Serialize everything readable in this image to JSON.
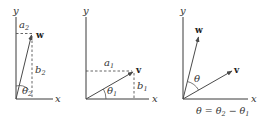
{
  "panels": [
    {
      "id": "w-components",
      "x_label": "x",
      "y_label": "y",
      "vector_label": "w",
      "horizontal_component": {
        "base": "a",
        "sub": "2"
      },
      "vertical_component": {
        "base": "b",
        "sub": "2"
      },
      "angle": {
        "base": "θ",
        "sub": "2"
      }
    },
    {
      "id": "v-components",
      "x_label": "x",
      "y_label": "y",
      "vector_label": "v",
      "horizontal_component": {
        "base": "a",
        "sub": "1"
      },
      "vertical_component": {
        "base": "b",
        "sub": "1"
      },
      "angle": {
        "base": "θ",
        "sub": "1"
      }
    },
    {
      "id": "angle-between",
      "x_label": "x",
      "y_label": "y",
      "vector_labels": [
        "w",
        "v"
      ],
      "angle": "θ",
      "caption": {
        "lhs": "θ",
        "eq": " = ",
        "t2": "θ",
        "t2_sub": "2",
        "minus": " − ",
        "t1": "θ",
        "t1_sub": "1"
      }
    }
  ]
}
